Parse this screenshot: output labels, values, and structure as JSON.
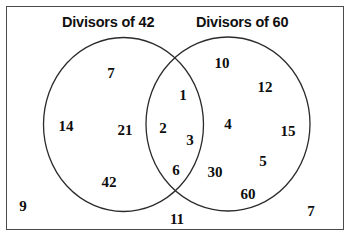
{
  "figure": {
    "type": "venn-diagram",
    "sets": 2,
    "border_color": "#4a4a4a",
    "background_color": "#ffffff",
    "text_color": "#0d0d0d"
  },
  "titles": {
    "left": "Divisors of 42",
    "right": "Divisors of 60"
  },
  "regions": {
    "left_only": {
      "label": "Divisors of 42 only",
      "values": [
        "7",
        "14",
        "21",
        "42"
      ]
    },
    "intersection": {
      "label": "Common divisors of 42 and 60",
      "values": [
        "1",
        "2",
        "3",
        "6"
      ]
    },
    "right_only": {
      "label": "Divisors of 60 only",
      "values": [
        "10",
        "12",
        "4",
        "15",
        "30",
        "5",
        "60"
      ]
    },
    "outside": {
      "label": "Outside both sets",
      "values": [
        "9",
        "11",
        "7"
      ]
    }
  },
  "labels": [
    {
      "name": "left-only-7",
      "text": "7",
      "x": 111,
      "y": 73
    },
    {
      "name": "left-only-14",
      "text": "14",
      "x": 66,
      "y": 126
    },
    {
      "name": "left-only-21",
      "text": "21",
      "x": 125,
      "y": 130
    },
    {
      "name": "left-only-42",
      "text": "42",
      "x": 109,
      "y": 182
    },
    {
      "name": "intersection-1",
      "text": "1",
      "x": 183,
      "y": 95
    },
    {
      "name": "intersection-2",
      "text": "2",
      "x": 163,
      "y": 128
    },
    {
      "name": "intersection-3",
      "text": "3",
      "x": 190,
      "y": 140
    },
    {
      "name": "intersection-6",
      "text": "6",
      "x": 176,
      "y": 170
    },
    {
      "name": "right-only-10",
      "text": "10",
      "x": 222,
      "y": 63
    },
    {
      "name": "right-only-12",
      "text": "12",
      "x": 265,
      "y": 87
    },
    {
      "name": "right-only-4",
      "text": "4",
      "x": 228,
      "y": 124
    },
    {
      "name": "right-only-15",
      "text": "15",
      "x": 288,
      "y": 131
    },
    {
      "name": "right-only-30",
      "text": "30",
      "x": 215,
      "y": 172
    },
    {
      "name": "right-only-5",
      "text": "5",
      "x": 263,
      "y": 161
    },
    {
      "name": "right-only-60",
      "text": "60",
      "x": 248,
      "y": 194
    },
    {
      "name": "outside-9",
      "text": "9",
      "x": 23,
      "y": 206
    },
    {
      "name": "outside-11",
      "text": "11",
      "x": 177,
      "y": 219
    },
    {
      "name": "outside-7",
      "text": "7",
      "x": 311,
      "y": 211
    }
  ],
  "circles": {
    "left": {
      "cx": 123.5,
      "cy": 124.5,
      "rx": 80,
      "ry": 87
    },
    "right": {
      "cx": 228,
      "cy": 124,
      "rx": 82,
      "ry": 87
    }
  }
}
